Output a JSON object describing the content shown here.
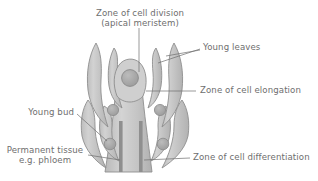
{
  "figure": {
    "background_color": "#ffffff",
    "label_color": "#6e6e6e",
    "tissue_fill": "#c9c9c9",
    "tissue_stroke": "#8c8c8c",
    "node_fill": "#a8a8a8",
    "phloem_fill": "#8f8f8f",
    "leader_color": "#6e6e6e"
  },
  "labels": {
    "zone_cell_division_line1": "Zone of cell division",
    "zone_cell_division_line2": "(apical meristem)",
    "young_leaves": "Young leaves",
    "zone_cell_elongation": "Zone of cell elongation",
    "young_bud": "Young bud",
    "permanent_tissue_line1": "Permanent tissue",
    "permanent_tissue_line2": "e.g. phloem",
    "zone_cell_differentiation": "Zone of cell differentiation"
  },
  "structures": {
    "apical_meristem_dome": "apical-dome",
    "meristem_circle": "meristem-circle",
    "leaf_primordia_count": 2,
    "outer_leaves_count": 2,
    "lower_leaves_count": 2,
    "bud_nodes_count": 4,
    "phloem_strands_count": 2,
    "stem": "central-stem"
  }
}
